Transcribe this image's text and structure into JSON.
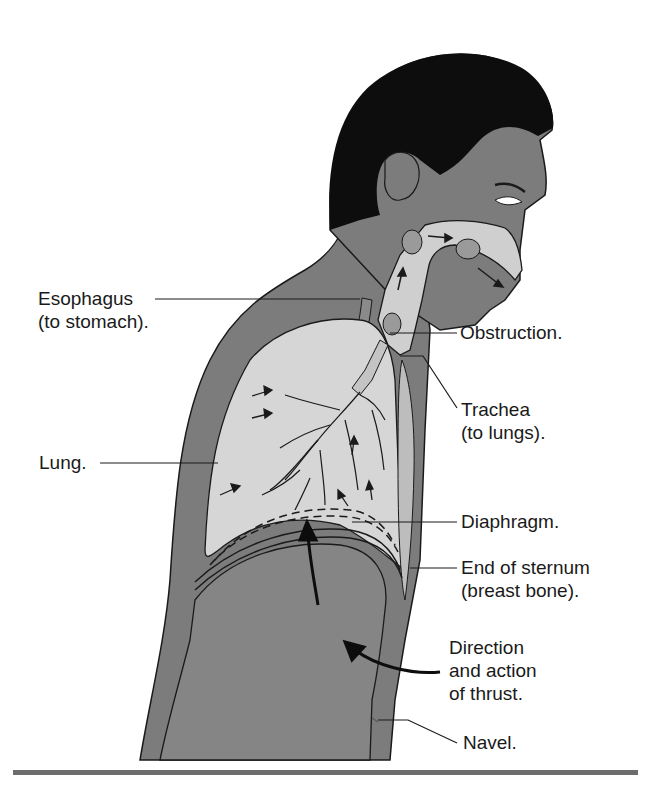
{
  "figure": {
    "colors": {
      "background": "#ffffff",
      "skin": "#7c7c7c",
      "hair": "#0d0d0d",
      "airway": "#cfcfcf",
      "lung": "#d6d6d6",
      "abdomen": "#858585",
      "outline": "#1a1a1a",
      "rule": "#6d6d6d"
    },
    "labels": {
      "esophagus": {
        "line1": "Esophagus",
        "line2": "(to stomach)."
      },
      "obstruction": {
        "line1": "Obstruction."
      },
      "trachea": {
        "line1": "Trachea",
        "line2": "(to lungs)."
      },
      "lung": {
        "line1": "Lung."
      },
      "diaphragm": {
        "line1": "Diaphragm."
      },
      "sternum": {
        "line1": "End of sternum",
        "line2": "(breast bone)."
      },
      "thrust": {
        "line1": "Direction",
        "line2": "and action",
        "line3": "of thrust."
      },
      "navel": {
        "line1": "Navel."
      }
    }
  }
}
